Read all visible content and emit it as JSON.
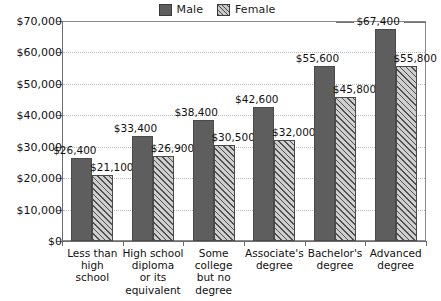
{
  "legend": {
    "entries": [
      {
        "label": "Male",
        "pattern": "solid",
        "color": "#5e5e5e",
        "icon": "legend-swatch-male"
      },
      {
        "label": "Female",
        "pattern": "diagonal-hatch",
        "color": "#c9c9c9",
        "icon": "legend-swatch-female"
      }
    ]
  },
  "axis": {
    "y_ticks": [
      "$0",
      "$10,000",
      "$20,000",
      "$30,000",
      "$40,000",
      "$50,000",
      "$60,000",
      "$70,000"
    ]
  },
  "chart_data": {
    "type": "bar",
    "title": "",
    "xlabel": "",
    "ylabel": "",
    "ylim": [
      0,
      70000
    ],
    "ytick_values": [
      0,
      10000,
      20000,
      30000,
      40000,
      50000,
      60000,
      70000
    ],
    "ytick_labels": [
      "$0",
      "$10,000",
      "$20,000",
      "$30,000",
      "$40,000",
      "$50,000",
      "$60,000",
      "$70,000"
    ],
    "grid": true,
    "legend_position": "top-center",
    "categories": [
      "Less than high school",
      "High school diploma or its equivalent",
      "Some college but no degree",
      "Associate's degree",
      "Bachelor's degree",
      "Advanced degree"
    ],
    "category_lines": [
      [
        "Less than",
        "high",
        "school"
      ],
      [
        "High school",
        "diploma",
        "or its",
        "equivalent"
      ],
      [
        "Some",
        "college",
        "but no",
        "degree"
      ],
      [
        "Associate's",
        "degree"
      ],
      [
        "Bachelor's",
        "degree"
      ],
      [
        "Advanced",
        "degree"
      ]
    ],
    "series": [
      {
        "name": "Male",
        "values": [
          26400,
          33400,
          38400,
          42600,
          55600,
          67400
        ],
        "labels": [
          "$26,400",
          "$33,400",
          "$38,400",
          "$42,600",
          "$55,600",
          "$67,400"
        ]
      },
      {
        "name": "Female",
        "values": [
          21100,
          26900,
          30500,
          32000,
          45800,
          55800
        ],
        "labels": [
          "$21,100",
          "$26,900",
          "$30,500",
          "$32,000",
          "$45,800",
          "$55,800"
        ]
      }
    ]
  }
}
